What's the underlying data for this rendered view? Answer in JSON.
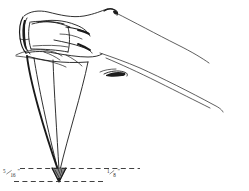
{
  "figure": {
    "title": "Hand holding sharpened pencil with point dimensions",
    "background_color": "#ffffff",
    "ink_color": "#1a1a1a",
    "shading_color": "#8b8b8b"
  },
  "dimensions": {
    "left": {
      "numerator": "5",
      "denominator": "16",
      "unit": "\"",
      "text": "5/16\"",
      "describes": "exposed-wood-taper-length"
    },
    "right": {
      "numerator": "1",
      "denominator": "8",
      "unit": "\"",
      "text": "1/8\"",
      "describes": "exposed-graphite-lead-length"
    }
  },
  "guides": {
    "upper_line_name": "wood-shoulder-guide-line",
    "lower_line_name": "pencil-point-guide-line"
  },
  "parts": {
    "hand": "hand-outline",
    "thumb": "thumb",
    "index_finger": "index-finger",
    "pencil_barrel": "pencil-barrel",
    "pencil_cone": "pencil-wood-cone",
    "pencil_tip": "pencil-graphite-tip"
  }
}
